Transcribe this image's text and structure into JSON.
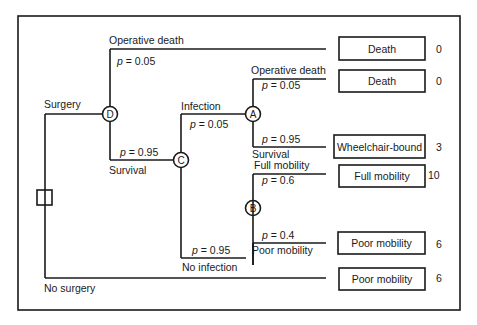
{
  "diagram": {
    "type": "decision-tree",
    "decision_node": {
      "label": "decision"
    },
    "branches": {
      "surgery": "Surgery",
      "no_surgery": "No surgery"
    },
    "chance_nodes": {
      "D": "D",
      "C": "C",
      "A": "A",
      "B": "B"
    },
    "edges": {
      "d_operative_death": {
        "label": "Operative death",
        "p_sym": "p",
        "p_val": " = 0.05"
      },
      "d_survival": {
        "label": "Survival",
        "p_sym": "p",
        "p_val": " = 0.95"
      },
      "c_infection": {
        "label": "Infection",
        "p_sym": "p",
        "p_val": " = 0.05"
      },
      "c_no_infection": {
        "label": "No infection",
        "p_sym": "p",
        "p_val": " = 0.95"
      },
      "a_operative_death": {
        "label": "Operative death",
        "p_sym": "p",
        "p_val": " = 0.05"
      },
      "a_survival": {
        "label": "Survival",
        "p_sym": "p",
        "p_val": " = 0.95"
      },
      "b_full_mobility": {
        "label": "Full mobility",
        "p_sym": "p",
        "p_val": " = 0.6"
      },
      "b_poor_mobility": {
        "label": "Poor mobility",
        "p_sym": "p",
        "p_val": " = 0.4"
      }
    },
    "outcomes": [
      {
        "label": "Death",
        "utility": "0"
      },
      {
        "label": "Death",
        "utility": "0"
      },
      {
        "label": "Wheelchair-bound",
        "utility": "3"
      },
      {
        "label": "Full mobility",
        "utility": "10"
      },
      {
        "label": "Poor mobility",
        "utility": "6"
      },
      {
        "label": "Poor mobility",
        "utility": "6"
      }
    ]
  }
}
